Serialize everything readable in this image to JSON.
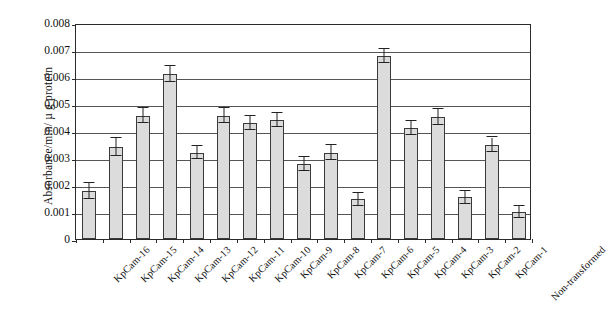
{
  "chart_data": {
    "type": "bar",
    "title": "",
    "subtitle": "",
    "xlabel": "",
    "ylabel": "Absorbance/min/ µ g protein",
    "ylim": [
      0,
      0.008
    ],
    "ytick_labels": [
      "0.008",
      "0.007",
      "0.006",
      "0.005",
      "0.004",
      "0.003",
      "0.002",
      "0.001",
      "0"
    ],
    "ytick_values": [
      0.008,
      0.007,
      0.006,
      0.005,
      0.004,
      0.003,
      0.002,
      0.001,
      0
    ],
    "grid": "horizontal",
    "legend": "none",
    "categories": [
      "KpCam-16",
      "KpCam-15",
      "KpCam-14",
      "KpCam-13",
      "KpCam-12",
      "KpCam-11",
      "KpCam-10",
      "KpCam-9",
      "KpCam-8",
      "KpCam-7",
      "KpCam-6",
      "KpCam-5",
      "KpCam-4",
      "KpCam-3",
      "KpCam-2",
      "KpCam-1",
      "Non-transformed"
    ],
    "values": [
      0.00178,
      0.0034,
      0.00456,
      0.00612,
      0.0032,
      0.00456,
      0.0043,
      0.0044,
      0.00278,
      0.0032,
      0.00148,
      0.00678,
      0.0041,
      0.00452,
      0.00155,
      0.0035,
      0.001
    ],
    "errors": [
      0.00028,
      0.00034,
      0.00028,
      0.0003,
      0.00024,
      0.00028,
      0.00026,
      0.00026,
      0.00026,
      0.00028,
      0.00024,
      0.00026,
      0.00026,
      0.0003,
      0.00024,
      0.00026,
      0.00022
    ],
    "bar_fill_color": "#dcdcdc",
    "bar_edge_color": "#3a3a3a",
    "error_bar_color": "#222222",
    "axis_color": "#2b2b2b",
    "background_color": "#ffffff"
  }
}
